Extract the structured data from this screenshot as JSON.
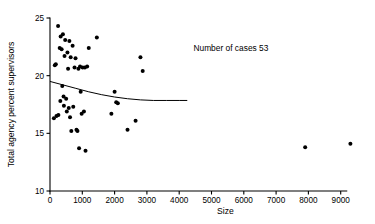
{
  "chart_data": {
    "type": "scatter",
    "title": "",
    "xlabel": "Size",
    "ylabel": "Total agency percent supervisors",
    "xlim": [
      0,
      9500
    ],
    "ylim": [
      10,
      25
    ],
    "xticks": [
      0,
      1000,
      2000,
      3000,
      4000,
      5000,
      6000,
      7000,
      8000,
      9000
    ],
    "xtick_labels": [
      "0",
      "1000",
      "2000",
      "3000",
      "4000",
      "5000",
      "6000",
      "7000",
      "8000",
      "9000"
    ],
    "yticks": [
      10,
      15,
      20,
      25
    ],
    "ytick_labels": [
      "10",
      "15",
      "20",
      "25"
    ],
    "grid": false,
    "legend": false,
    "annotations": [
      {
        "text": "Number of cases 53",
        "x": 5600,
        "y": 22.1
      }
    ],
    "series": [
      {
        "name": "agencies",
        "marker": "filled-circle",
        "color": "#000000",
        "points": [
          [
            120,
            16.3
          ],
          [
            150,
            20.9
          ],
          [
            180,
            21.0
          ],
          [
            200,
            16.5
          ],
          [
            250,
            24.3
          ],
          [
            260,
            16.6
          ],
          [
            300,
            22.4
          ],
          [
            320,
            17.8
          ],
          [
            330,
            23.4
          ],
          [
            360,
            22.3
          ],
          [
            380,
            19.1
          ],
          [
            400,
            23.6
          ],
          [
            420,
            18.2
          ],
          [
            430,
            17.4
          ],
          [
            450,
            21.7
          ],
          [
            470,
            23.1
          ],
          [
            500,
            18.0
          ],
          [
            520,
            16.9
          ],
          [
            540,
            22.0
          ],
          [
            560,
            20.6
          ],
          [
            580,
            17.2
          ],
          [
            600,
            23.0
          ],
          [
            620,
            16.4
          ],
          [
            640,
            21.6
          ],
          [
            660,
            15.2
          ],
          [
            700,
            22.6
          ],
          [
            720,
            17.3
          ],
          [
            760,
            20.7
          ],
          [
            790,
            21.5
          ],
          [
            820,
            15.3
          ],
          [
            850,
            15.2
          ],
          [
            880,
            20.6
          ],
          [
            900,
            13.7
          ],
          [
            930,
            20.8
          ],
          [
            950,
            18.6
          ],
          [
            980,
            16.7
          ],
          [
            1010,
            20.7
          ],
          [
            1050,
            16.9
          ],
          [
            1080,
            20.7
          ],
          [
            1100,
            13.5
          ],
          [
            1150,
            20.8
          ],
          [
            1200,
            22.4
          ],
          [
            1450,
            23.3
          ],
          [
            1900,
            16.7
          ],
          [
            2000,
            18.6
          ],
          [
            2050,
            17.7
          ],
          [
            2100,
            17.6
          ],
          [
            2400,
            15.3
          ],
          [
            2650,
            16.1
          ],
          [
            2800,
            21.6
          ],
          [
            2870,
            20.4
          ],
          [
            7900,
            13.8
          ],
          [
            9300,
            14.1
          ]
        ]
      }
    ],
    "fit_curve": {
      "name": "fitted-trend",
      "color": "#000000",
      "points": [
        [
          0,
          19.5
        ],
        [
          400,
          19.2
        ],
        [
          800,
          18.9
        ],
        [
          1200,
          18.6
        ],
        [
          1600,
          18.35
        ],
        [
          2000,
          18.15
        ],
        [
          2400,
          18.0
        ],
        [
          2800,
          17.9
        ],
        [
          3200,
          17.85
        ],
        [
          3600,
          17.85
        ],
        [
          4000,
          17.85
        ],
        [
          4250,
          17.85
        ]
      ]
    }
  }
}
